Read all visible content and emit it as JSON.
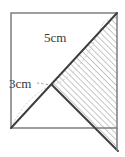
{
  "figure": {
    "type": "geometry-diagram",
    "background_color": "#ffffff",
    "square": {
      "name": "outer-square",
      "x": 11,
      "y": 13,
      "width": 106,
      "height": 115,
      "stroke_color": "#808080",
      "stroke_width": 1.4
    },
    "labels": [
      {
        "id": "5cm",
        "text": "5cm",
        "x": 44,
        "y": 31,
        "color": "#3a3a3a",
        "font_size": 13
      },
      {
        "id": "3cm",
        "text": "3cm",
        "x": 9,
        "y": 77,
        "color": "#3a3a3a",
        "font_size": 13
      }
    ],
    "points": {
      "top_left": [
        11,
        13
      ],
      "top_right": [
        117,
        13
      ],
      "bottom_left": [
        11,
        128
      ],
      "bottom_right": [
        117,
        128
      ],
      "center_vertex": [
        52,
        85
      ],
      "lower_right_extension": [
        117,
        150
      ],
      "right_edge_crossing": [
        117,
        128
      ]
    },
    "solid_lines": [
      {
        "name": "main-diagonal",
        "from": [
          11,
          128
        ],
        "to": [
          117,
          13
        ],
        "stroke_color": "#3a3a3a",
        "stroke_width": 1.8
      },
      {
        "name": "vertex-to-lower-right",
        "from": [
          52,
          85
        ],
        "to": [
          117,
          150
        ],
        "stroke_color": "#3a3a3a",
        "stroke_width": 1.8
      }
    ],
    "construction_lines": [
      {
        "name": "arc-upper",
        "kind": "arc",
        "stroke_color": "#c4c4c4",
        "stroke_width": 1,
        "dash": "2 2"
      },
      {
        "name": "arc-lower",
        "kind": "arc",
        "stroke_color": "#c8c8c8",
        "stroke_width": 1,
        "dash": "2 2"
      },
      {
        "name": "leader-3cm",
        "kind": "segment",
        "from": [
          36,
          83
        ],
        "to": [
          52,
          85
        ],
        "stroke_color": "#9a9a9a",
        "stroke_width": 1,
        "dash": "2 2"
      }
    ],
    "shaded_region": {
      "name": "hatched-triangle",
      "vertices": [
        [
          52,
          85
        ],
        [
          117,
          13
        ],
        [
          117,
          150
        ]
      ],
      "hatch_color": "#a8a8a8",
      "hatch_angle_deg": 45,
      "hatch_spacing": 3,
      "fill": "none"
    }
  }
}
